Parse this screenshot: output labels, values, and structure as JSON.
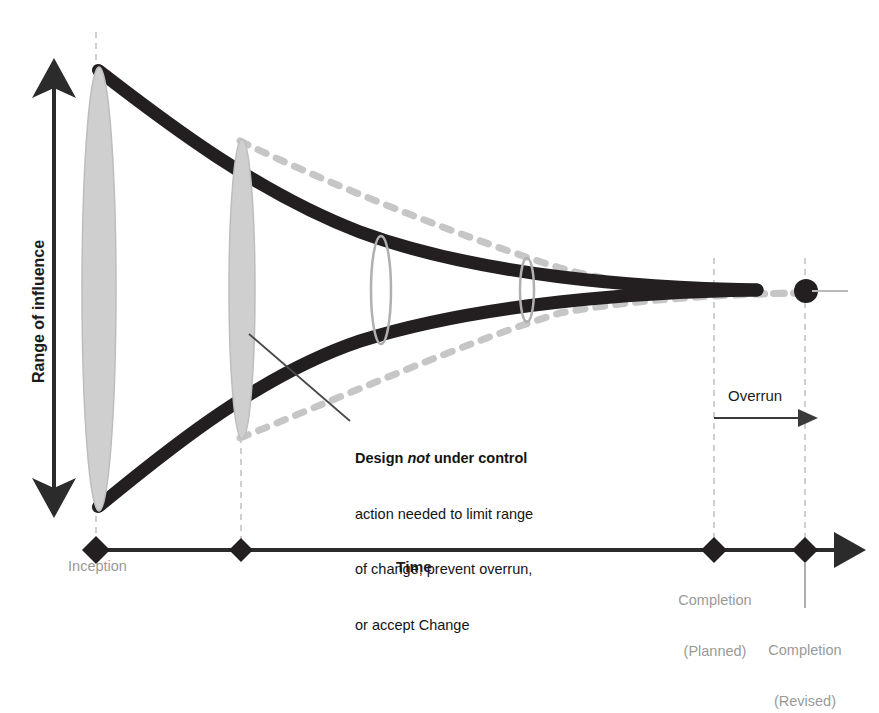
{
  "diagram": {
    "y_axis": {
      "label": "Range of influence",
      "arrow_style": "double-headed-vertical"
    },
    "x_axis": {
      "label": "Time",
      "arrow_style": "single-headed-right",
      "ticks": [
        {
          "id": "inception",
          "label": "Inception",
          "label_line2": ""
        },
        {
          "id": "second-milestone",
          "label": "",
          "label_line2": ""
        },
        {
          "id": "completion-planned",
          "label": "Completion",
          "label_line2": "(Planned)"
        },
        {
          "id": "completion-revised",
          "label": "Completion",
          "label_line2": "(Revised)"
        }
      ]
    },
    "annotation": {
      "heading_before": "Design ",
      "heading_italic": "not",
      "heading_after": " under control",
      "line2": "action needed to limit range",
      "line3": "of change, prevent overrun,",
      "line4": "or accept Change"
    },
    "overrun": {
      "label": "Overrun"
    },
    "colors": {
      "curve_controlled": "#231f20",
      "curve_uncontrolled": "#c6c6c6",
      "ellipse_fill": "#cfcfcf",
      "ellipse_stroke": "#b4b4b4",
      "axis": "#2b2b2b",
      "guide_line": "#bdbdbd",
      "tick_label": "#9a9a9a",
      "text": "#141414"
    },
    "elements": {
      "ellipse_inception": "range-of-influence-at-inception",
      "ellipse_second": "range-of-influence-at-second-milestone",
      "ellipse_small_a": "narrowed-range-marker-a",
      "ellipse_small_b": "narrowed-range-marker-b",
      "convergence_dot": "revised-completion-point"
    }
  },
  "bottom_caption": "(Revised)"
}
